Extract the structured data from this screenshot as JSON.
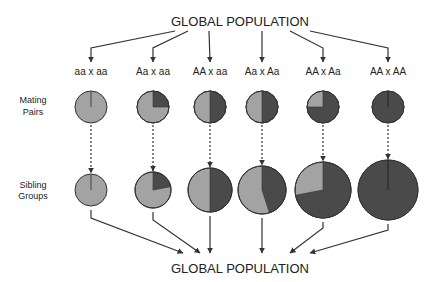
{
  "diagram": {
    "top_title": "GLOBAL POPULATION",
    "bottom_title": "GLOBAL POPULATION",
    "row_labels": {
      "mating_pairs": [
        "Mating",
        "Pairs"
      ],
      "sibling_groups": [
        "Sibling",
        "Groups"
      ]
    },
    "colors": {
      "light": "#a3a3a3",
      "dark": "#4a4a4a",
      "stroke": "#333333",
      "line": "#333333"
    },
    "columns": [
      {
        "genotype": "aa x aa",
        "x": 91,
        "mating_dark_fraction": 0.0,
        "sibling_dark_fraction": 0.0,
        "sibling_radius": 16
      },
      {
        "genotype": "Aa x aa",
        "x": 153,
        "mating_dark_fraction": 0.25,
        "sibling_dark_fraction": 0.22,
        "sibling_radius": 18
      },
      {
        "genotype": "AA x aa",
        "x": 210,
        "mating_dark_fraction": 0.5,
        "sibling_dark_fraction": 0.5,
        "sibling_radius": 22
      },
      {
        "genotype": "Aa x Aa",
        "x": 262,
        "mating_dark_fraction": 0.5,
        "sibling_dark_fraction": 0.45,
        "sibling_radius": 24
      },
      {
        "genotype": "AA x Aa",
        "x": 323,
        "mating_dark_fraction": 0.75,
        "sibling_dark_fraction": 0.72,
        "sibling_radius": 28
      },
      {
        "genotype": "AA x AA",
        "x": 388,
        "mating_dark_fraction": 1.0,
        "sibling_dark_fraction": 1.0,
        "sibling_radius": 30
      }
    ]
  }
}
